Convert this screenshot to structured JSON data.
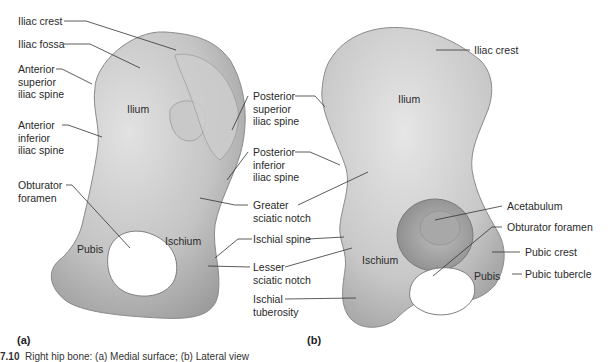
{
  "figure": {
    "caption_number": "7.10",
    "caption_text": "Right hip bone: (a) Medial surface; (b) Lateral view",
    "panels": [
      {
        "tag": "(a)",
        "view": "medial"
      },
      {
        "tag": "(b)",
        "view": "lateral"
      }
    ]
  },
  "panel_a": {
    "regions": {
      "ilium": "Ilium",
      "pubis": "Pubis",
      "ischium": "Ischium"
    },
    "left_labels": {
      "iliac_crest": "Iliac crest",
      "iliac_fossa": "Iliac fossa",
      "asis": "Anterior\nsuperior\niliac spine",
      "aiis": "Anterior\ninferior\niliac spine",
      "obturator_foramen": "Obturator\nforamen"
    }
  },
  "middle_labels": {
    "psis": "Posterior\nsuperior\niliac spine",
    "piis": "Posterior\ninferior\niliac spine",
    "greater_sciatic_notch": "Greater\nsciatic notch",
    "ischial_spine": "Ischial spine",
    "lesser_sciatic_notch": "Lesser\nsciatic notch",
    "ischial_tuberosity": "Ischial\ntuberosity"
  },
  "panel_b": {
    "regions": {
      "ilium": "Ilium",
      "ischium": "Ischium",
      "pubis": "Pubis"
    },
    "right_labels": {
      "iliac_crest": "Iliac crest",
      "acetabulum": "Acetabulum",
      "obturator_foramen": "Obturator foramen",
      "pubic_crest": "Pubic crest",
      "pubic_tubercle": "Pubic tubercle"
    }
  },
  "colors": {
    "bone_light": "#d9d9d9",
    "bone_mid": "#b8b8b8",
    "bone_dark": "#8f8f8f",
    "leader_line": "#333333",
    "text": "#2a2a2a"
  }
}
